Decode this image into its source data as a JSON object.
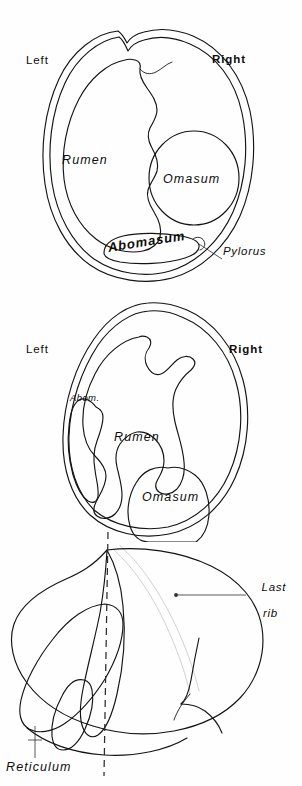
{
  "figure": {
    "background_color": "#fefefe",
    "ink_color": "#141414",
    "faint_rib_color": "#c9c9c9",
    "panels": [
      {
        "id": "panel-cranial-cross-section",
        "view": "cross-section",
        "orientation_labels": {
          "left": "Left",
          "right": "Right"
        },
        "organ_labels": [
          "Rumen",
          "Omasum",
          "Abomasum"
        ],
        "callout_labels": [
          "Pylorus"
        ]
      },
      {
        "id": "panel-caudal-cross-section",
        "view": "cross-section",
        "orientation_labels": {
          "left": "Left",
          "right": "Right"
        },
        "organ_labels": [
          "Abom.",
          "Rumen",
          "Omasum"
        ],
        "callout_labels": []
      },
      {
        "id": "panel-lateral-view",
        "view": "lateral",
        "orientation_labels": {},
        "organ_labels": [],
        "callout_labels": [
          "Last rib",
          "Reticulum"
        ],
        "guides": [
          "median-dashed-line",
          "last-rib-outline"
        ]
      }
    ]
  },
  "panel1": {
    "left": "Left",
    "right": "Right",
    "rumen": "Rumen",
    "omasum": "Omasum",
    "abomasum": "Abomasum",
    "pylorus": "Pylorus"
  },
  "panel2": {
    "left": "Left",
    "right": "Right",
    "abom": "Abom.",
    "rumen": "Rumen",
    "omasum": "Omasum"
  },
  "panel3": {
    "last_rib_line1": "Last",
    "last_rib_line2": "rib",
    "reticulum": "Reticulum"
  }
}
